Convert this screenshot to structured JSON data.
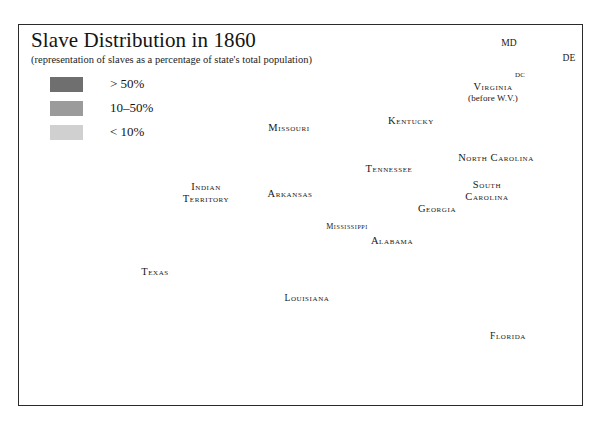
{
  "document": {
    "title": "Slave Distribution in 1860",
    "subtitle": "(representation of slaves as a percentage of state's total population)"
  },
  "legend": {
    "name": "map-legend",
    "items": [
      {
        "label": "> 50%",
        "color": "#6f6f6f",
        "key": "over-50"
      },
      {
        "label": "10–50%",
        "color": "#9b9b9b",
        "key": "10-to-50"
      },
      {
        "label": "< 10%",
        "color": "#d0d0d0",
        "key": "under-10"
      }
    ]
  },
  "colors": {
    "high": "#6f6f6f",
    "medium": "#9b9b9b",
    "low": "#d0d0d0",
    "none": "#ffffff",
    "outline": "#2b2b2b",
    "state_line": "#3a3a3a",
    "frame": "#2b2b2b",
    "text": "#171717",
    "page": "#ffffff"
  },
  "map": {
    "name": "slave-distribution-map",
    "projection_note": "southern United States, 1860 boundaries",
    "labels": [
      {
        "key": "missouri",
        "text": "Missouri",
        "x": 289,
        "y": 127,
        "size": "lg"
      },
      {
        "key": "kentucky",
        "text": "Kentucky",
        "x": 411,
        "y": 120,
        "size": "lg"
      },
      {
        "key": "tennessee",
        "text": "Tennessee",
        "x": 389,
        "y": 168,
        "size": "lg"
      },
      {
        "key": "arkansas",
        "text": "Arkansas",
        "x": 290,
        "y": 193,
        "size": "lg"
      },
      {
        "key": "indian-territory",
        "text": "Indian",
        "text2": "Territory",
        "x": 206,
        "y": 192,
        "size": "lg"
      },
      {
        "key": "texas",
        "text": "Texas",
        "x": 155,
        "y": 271,
        "size": "lg"
      },
      {
        "key": "louisiana",
        "text": "Louisiana",
        "x": 307,
        "y": 298,
        "size": "md"
      },
      {
        "key": "mississippi",
        "text": "Mississippi",
        "x": 347,
        "y": 226,
        "size": "sm"
      },
      {
        "key": "alabama",
        "text": "Alabama",
        "x": 392,
        "y": 240,
        "size": "lg"
      },
      {
        "key": "georgia",
        "text": "Georgia",
        "x": 437,
        "y": 208,
        "size": "lg"
      },
      {
        "key": "florida",
        "text": "Florida",
        "x": 508,
        "y": 336,
        "size": "md"
      },
      {
        "key": "south-carolina",
        "text": "South",
        "text2": "Carolina",
        "x": 487,
        "y": 190,
        "size": "lg"
      },
      {
        "key": "north-carolina",
        "text": "North Carolina",
        "x": 496,
        "y": 157,
        "size": "lg"
      },
      {
        "key": "virginia",
        "text": "Virginia",
        "x": 493,
        "y": 92,
        "size": "lg",
        "paren": "(before W.V.)"
      },
      {
        "key": "maryland",
        "text": "MD",
        "x": 509,
        "y": 43,
        "size": "md",
        "plain": true
      },
      {
        "key": "delaware",
        "text": "DE",
        "x": 569,
        "y": 58,
        "size": "md",
        "plain": true
      },
      {
        "key": "district-of-columbia",
        "text": "DC",
        "x": 520,
        "y": 75,
        "size": "xs",
        "plain": true
      }
    ],
    "leader_lines": [
      {
        "key": "md-leader",
        "x1": 513,
        "y1": 49,
        "x2": 528,
        "y2": 66
      },
      {
        "key": "dc-leader",
        "x1": 525,
        "y1": 80,
        "x2": 537,
        "y2": 90
      }
    ]
  }
}
